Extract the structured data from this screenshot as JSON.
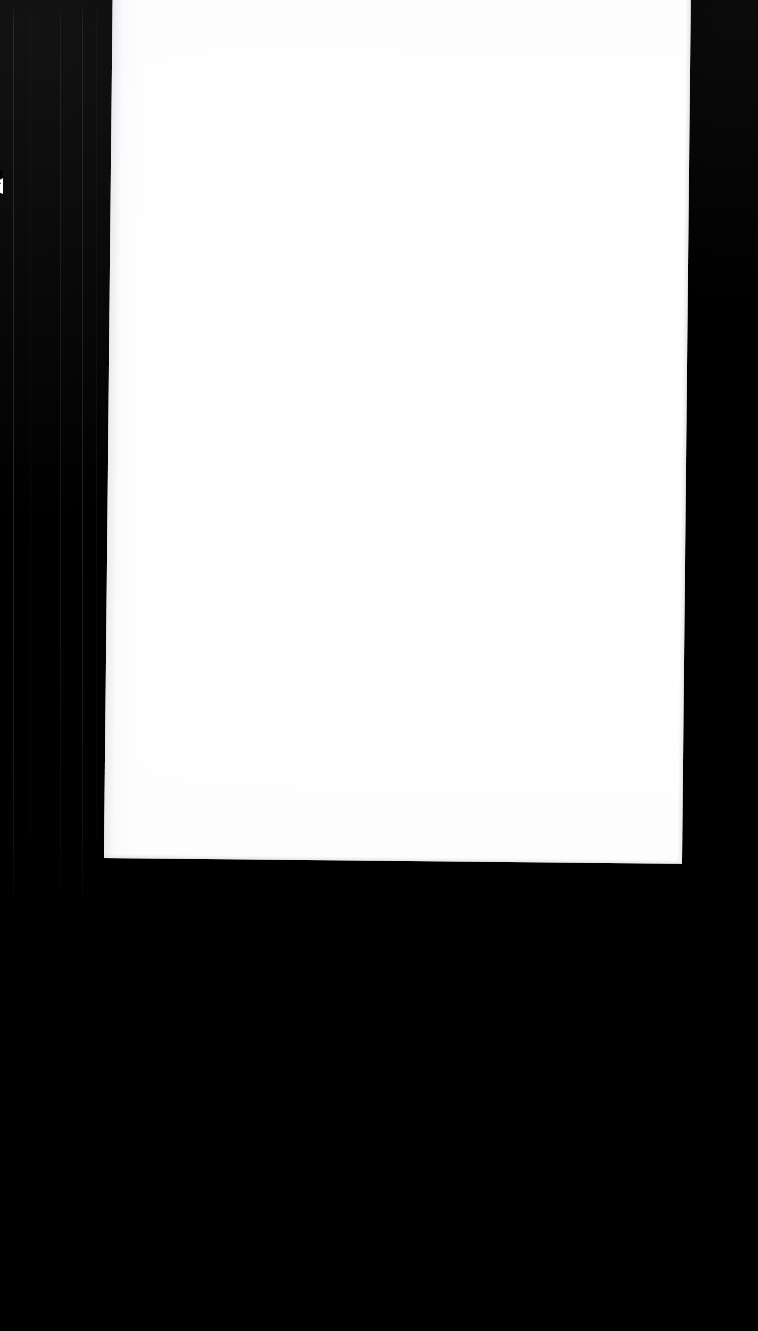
{
  "scene": {
    "kind": "scanned-document-photo",
    "description": "Blank white page on black background",
    "canvas_width": 758,
    "canvas_height": 1331
  },
  "colors": {
    "background": "#000000",
    "page": "#ffffff",
    "page_shadow_edge": "#e2e4e7",
    "seam_line": "#2c2c2c"
  },
  "page": {
    "label": "",
    "body_text": "",
    "is_blank": true,
    "left": 106,
    "top": 0,
    "right": 682,
    "bottom": 852,
    "rotation_deg": 0.58
  },
  "artifacts": {
    "notch_label": "",
    "seam_positions": [
      13,
      60,
      82
    ]
  }
}
